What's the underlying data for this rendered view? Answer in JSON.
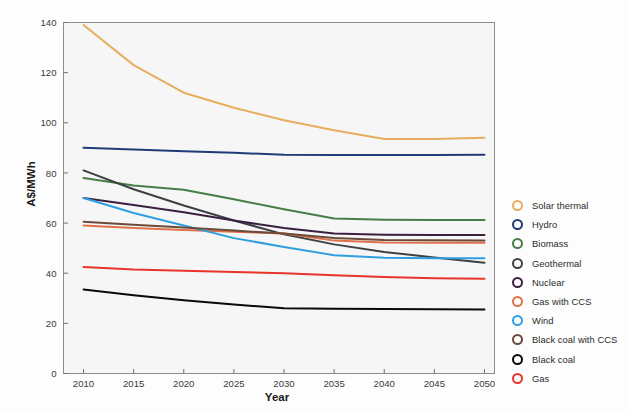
{
  "chart_data": {
    "type": "line",
    "title": "",
    "xlabel": "Year",
    "ylabel": "A$/MWh",
    "x": [
      2010,
      2015,
      2020,
      2025,
      2030,
      2035,
      2040,
      2045,
      2050
    ],
    "xlim": [
      2008,
      2051
    ],
    "ylim": [
      0,
      140
    ],
    "xticks": [
      "2010",
      "2015",
      "2020",
      "2025",
      "2030",
      "2035",
      "2040",
      "2045",
      "2050"
    ],
    "yticks": [
      "0",
      "20",
      "40",
      "60",
      "80",
      "100",
      "120",
      "140"
    ],
    "grid": false,
    "legend_position": "right",
    "series": [
      {
        "name": "Solar thermal",
        "color": "#e8ae5e",
        "values": [
          139.0,
          123.0,
          112.0,
          106.0,
          101.0,
          97.0,
          93.5,
          93.5,
          94.0
        ]
      },
      {
        "name": "Hydro",
        "color": "#1f3c76",
        "values": [
          90.0,
          89.3,
          88.6,
          88.0,
          87.3,
          87.2,
          87.2,
          87.2,
          87.3
        ]
      },
      {
        "name": "Biomass",
        "color": "#477d46",
        "values": [
          78.0,
          75.0,
          73.3,
          69.5,
          65.5,
          61.8,
          61.3,
          61.2,
          61.2
        ]
      },
      {
        "name": "Geothermal",
        "color": "#3d4144",
        "values": [
          81.0,
          73.5,
          67.0,
          61.0,
          55.5,
          51.5,
          48.5,
          46.3,
          44.2
        ]
      },
      {
        "name": "Nuclear",
        "color": "#3b1f40",
        "values": [
          70.0,
          67.2,
          64.3,
          61.0,
          58.0,
          55.8,
          55.3,
          55.2,
          55.2
        ]
      },
      {
        "name": "Gas with CCS",
        "color": "#e0704a",
        "values": [
          59.0,
          58.0,
          57.2,
          56.5,
          55.8,
          53.0,
          52.3,
          52.2,
          52.2
        ]
      },
      {
        "name": "Wind",
        "color": "#2e9fe0",
        "values": [
          70.0,
          64.0,
          59.0,
          54.0,
          50.5,
          47.2,
          46.2,
          46.0,
          46.0
        ]
      },
      {
        "name": "Black coal with CCS",
        "color": "#6b4a3a",
        "values": [
          60.5,
          59.3,
          58.2,
          57.0,
          55.8,
          54.0,
          53.2,
          53.1,
          53.0
        ]
      },
      {
        "name": "Black coal",
        "color": "#0a0a0a",
        "values": [
          33.5,
          31.2,
          29.2,
          27.5,
          26.0,
          25.8,
          25.7,
          25.6,
          25.5
        ]
      },
      {
        "name": "Gas",
        "color": "#e8342b",
        "values": [
          42.5,
          41.5,
          41.0,
          40.5,
          40.0,
          39.2,
          38.5,
          38.0,
          37.8
        ]
      }
    ]
  }
}
